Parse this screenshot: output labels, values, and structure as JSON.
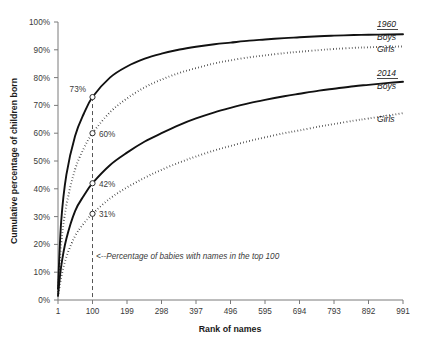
{
  "chart_data": {
    "type": "line",
    "title": "",
    "xlabel": "Rank of names",
    "ylabel": "Cumulative percentage of children born",
    "xlim": [
      1,
      991
    ],
    "ylim": [
      0,
      100
    ],
    "grid": false,
    "legend_position": "right",
    "x_ticks": [
      "1",
      "100",
      "199",
      "298",
      "397",
      "496",
      "595",
      "694",
      "793",
      "892",
      "991"
    ],
    "x_tick_values": [
      1,
      100,
      199,
      298,
      397,
      496,
      595,
      694,
      793,
      892,
      991
    ],
    "y_ticks": [
      "0%",
      "10%",
      "20%",
      "30%",
      "40%",
      "50%",
      "60%",
      "70%",
      "80%",
      "90%",
      "100%"
    ],
    "y_tick_values": [
      0,
      10,
      20,
      30,
      40,
      50,
      60,
      70,
      80,
      90,
      100
    ],
    "series": [
      {
        "name": "1960 Boys",
        "group": "1960",
        "label": "Boys",
        "style": "solid",
        "x": [
          1,
          10,
          25,
          50,
          75,
          100,
          150,
          199,
          250,
          298,
          350,
          397,
          450,
          496,
          550,
          595,
          650,
          694,
          750,
          793,
          850,
          892,
          950,
          991
        ],
        "y": [
          4,
          28,
          45,
          59,
          67,
          73,
          80,
          84,
          86.8,
          88.6,
          90.1,
          91.1,
          92.0,
          92.6,
          93.3,
          93.7,
          94.2,
          94.5,
          94.9,
          95.1,
          95.3,
          95.4,
          95.5,
          95.6
        ]
      },
      {
        "name": "1960 Girls",
        "group": "1960",
        "label": "Girls",
        "style": "dotted",
        "x": [
          1,
          10,
          25,
          50,
          75,
          100,
          150,
          199,
          250,
          298,
          350,
          397,
          450,
          496,
          550,
          595,
          650,
          694,
          750,
          793,
          850,
          892,
          950,
          991
        ],
        "y": [
          3,
          20,
          34,
          47,
          54.5,
          60,
          67.5,
          72.5,
          76.5,
          79.3,
          81.7,
          83.4,
          85.1,
          86.2,
          87.3,
          88.0,
          88.8,
          89.3,
          89.9,
          90.3,
          90.7,
          90.9,
          91.1,
          91.2
        ]
      },
      {
        "name": "2014 Boys",
        "group": "2014",
        "label": "Boys",
        "style": "solid",
        "x": [
          1,
          10,
          25,
          50,
          75,
          100,
          150,
          199,
          250,
          298,
          350,
          397,
          450,
          496,
          550,
          595,
          650,
          694,
          750,
          793,
          850,
          892,
          950,
          991
        ],
        "y": [
          1.6,
          12,
          22,
          32,
          37.5,
          42,
          48.5,
          53,
          57,
          60,
          63,
          65.3,
          67.5,
          69.1,
          70.8,
          72.0,
          73.3,
          74.2,
          75.3,
          76.0,
          76.9,
          77.4,
          78.1,
          78.5
        ]
      },
      {
        "name": "2014 Girls",
        "group": "2014",
        "label": "Girls",
        "style": "dotted",
        "x": [
          1,
          10,
          25,
          50,
          75,
          100,
          150,
          199,
          250,
          298,
          350,
          397,
          450,
          496,
          550,
          595,
          650,
          694,
          750,
          793,
          850,
          892,
          950,
          991
        ],
        "y": [
          1.1,
          8,
          15.5,
          23,
          27.5,
          31,
          36.5,
          40.5,
          44.0,
          46.8,
          49.5,
          51.6,
          53.8,
          55.4,
          57.2,
          58.5,
          60.0,
          61.0,
          62.4,
          63.3,
          64.5,
          65.3,
          66.4,
          67.2
        ]
      }
    ],
    "annotations": [
      {
        "name": "point-1960-boys",
        "text": "73%",
        "x": 100,
        "y": 73
      },
      {
        "name": "point-1960-girls",
        "text": "60%",
        "x": 100,
        "y": 60
      },
      {
        "name": "point-2014-boys",
        "text": "42%",
        "x": 100,
        "y": 42
      },
      {
        "name": "point-2014-girls",
        "text": "31%",
        "x": 100,
        "y": 31
      },
      {
        "name": "top100-note",
        "text": "<--Percentage of babies with names in the top 100",
        "x": 100,
        "y": 14
      }
    ],
    "reference_line": {
      "name": "rank-100-reference",
      "x": 100,
      "from_y": 0,
      "to_y": 73,
      "style": "dashed"
    }
  },
  "labels": {
    "y_axis_title": "Cumulative percentage of children born",
    "x_axis_title": "Rank of names",
    "y_ticks": [
      "100%",
      "90%",
      "80%",
      "70%",
      "60%",
      "50%",
      "40%",
      "30%",
      "20%",
      "10%",
      "0%"
    ],
    "x_ticks": [
      "1",
      "100",
      "199",
      "298",
      "397",
      "496",
      "595",
      "694",
      "793",
      "892",
      "991"
    ],
    "point_labels": [
      "73%",
      "60%",
      "42%",
      "31%"
    ],
    "annotation": "<--Percentage of babies with names in the top 100"
  },
  "legend": {
    "groups": [
      {
        "header": "1960",
        "items": [
          {
            "label": "Boys",
            "style": "solid"
          },
          {
            "label": "Girls",
            "style": "dotted"
          }
        ]
      },
      {
        "header": "2014",
        "items": [
          {
            "label": "Boys",
            "style": "solid"
          },
          {
            "label": "Girls",
            "style": "dotted"
          }
        ]
      }
    ],
    "g1_header": "1960",
    "g1_boys": "Boys",
    "g1_girls": "Girls",
    "g2_header": "2014",
    "g2_boys": "Boys",
    "g2_girls": "Girls"
  },
  "colors": {
    "line": "#111111",
    "axis": "#7a7a7a",
    "text": "#2b2b2b",
    "background": "#ffffff"
  }
}
